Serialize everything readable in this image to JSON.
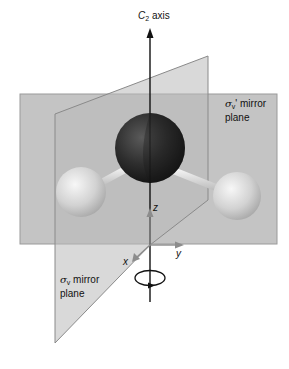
{
  "diagram": {
    "axis_label": {
      "symbol": "C",
      "subscript": "2",
      "text": "axis"
    },
    "plane_back": {
      "symbol": "σ",
      "subscript": "v",
      "prime": "'",
      "line1": "mirror",
      "line2": "plane"
    },
    "plane_front": {
      "symbol": "σ",
      "subscript": "v",
      "line1": "mirror",
      "line2": "plane"
    },
    "coord_axes": {
      "x": "x",
      "y": "y",
      "z": "z"
    },
    "atoms": [
      {
        "name": "O",
        "role": "oxygen"
      },
      {
        "name": "H",
        "role": "hydrogen-left"
      },
      {
        "name": "H",
        "role": "hydrogen-right"
      }
    ],
    "colors": {
      "plane_fill": "#c9c9c9",
      "plane_edge": "#8a8a8a",
      "oxygen": "#2a2a2a",
      "hydrogen": "#dcdcdc",
      "axis_line": "#111111",
      "coord_arrow": "#8c8c8c"
    }
  }
}
